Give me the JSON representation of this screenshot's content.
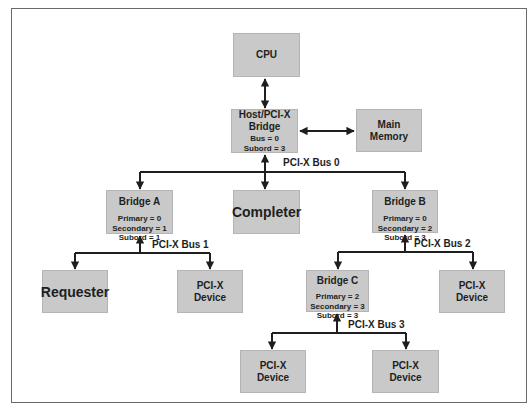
{
  "diagram": {
    "nodes": {
      "cpu": {
        "label": "CPU"
      },
      "host_bridge": {
        "label_line1": "Host/PCI-X",
        "label_line2": "Bridge",
        "bus": "Bus = 0",
        "subord": "Subord = 3"
      },
      "main_memory": {
        "label_line1": "Main",
        "label_line2": "Memory"
      },
      "completer": {
        "label": "Completer"
      },
      "bridge_a": {
        "label": "Bridge A",
        "primary": "Primary = 0",
        "secondary": "Secondary = 1",
        "subord": "Subord = 1"
      },
      "bridge_b": {
        "label": "Bridge B",
        "primary": "Primary = 0",
        "secondary": "Secondary = 2",
        "subord": "Subord = 3"
      },
      "bridge_c": {
        "label": "Bridge C",
        "primary": "Primary = 2",
        "secondary": "Secondary = 3",
        "subord": "Subord = 3"
      },
      "requester": {
        "label": "Requester"
      },
      "device_bus1": {
        "label_line1": "PCI-X",
        "label_line2": "Device"
      },
      "device_bus2": {
        "label_line1": "PCI-X",
        "label_line2": "Device"
      },
      "device_bus3_left": {
        "label_line1": "PCI-X",
        "label_line2": "Device"
      },
      "device_bus3_right": {
        "label_line1": "PCI-X",
        "label_line2": "Device"
      }
    },
    "buses": {
      "bus0": "PCI-X Bus 0",
      "bus1": "PCI-X Bus 1",
      "bus2": "PCI-X Bus 2",
      "bus3": "PCI-X Bus 3"
    },
    "colors": {
      "box_fill": "#c9c9c9",
      "line": "#1e1e1e",
      "frame": "#6a6a6a"
    }
  }
}
